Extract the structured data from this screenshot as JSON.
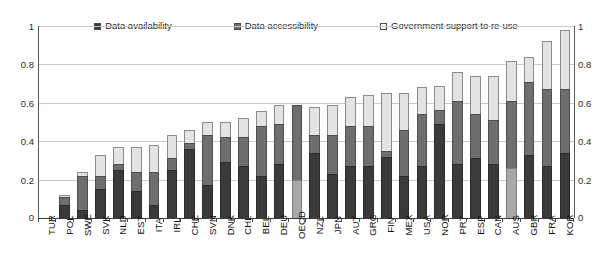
{
  "chart_data": {
    "type": "bar",
    "subtype": "stacked-bar",
    "title": "",
    "subtitle": "",
    "xlabel": "",
    "ylabel": "",
    "ylim": [
      0,
      1
    ],
    "yticks": [
      "0",
      "0.2",
      "0.4",
      "0.6",
      "0.8",
      "1"
    ],
    "ytick_values": [
      0,
      0.2,
      0.4,
      0.6,
      0.8,
      1
    ],
    "right_axis_yticks": [
      "0",
      "0.2",
      "0.4",
      "0.6",
      "0.8",
      "1"
    ],
    "grid": true,
    "grid_axis": "y",
    "legend_position": "top-center",
    "stacked": true,
    "categories": [
      "TUR",
      "POL",
      "SWE",
      "SVK",
      "NLD",
      "EST",
      "ITA",
      "IRL",
      "CHE",
      "SVN",
      "DNK",
      "CHL",
      "BEL",
      "DEU",
      "OECD",
      "NZL",
      "JPN",
      "AUT",
      "GRC",
      "FIN",
      "MEX",
      "USA",
      "NOR",
      "PRT",
      "ESP",
      "CAN",
      "AUS",
      "GBR",
      "FRA",
      "KOR"
    ],
    "series": [
      {
        "name": "Data availability",
        "color": "#3a3a3a",
        "values": [
          0.0,
          0.07,
          0.04,
          0.15,
          0.25,
          0.14,
          0.07,
          0.25,
          0.36,
          0.17,
          0.29,
          0.27,
          0.22,
          0.28,
          0.2,
          0.34,
          0.23,
          0.27,
          0.27,
          0.32,
          0.22,
          0.27,
          0.49,
          0.28,
          0.31,
          0.28,
          0.26,
          0.33,
          0.27,
          0.34
        ]
      },
      {
        "name": "Data accessibility",
        "color": "#6e6e6e",
        "values": [
          0.0,
          0.04,
          0.18,
          0.07,
          0.03,
          0.1,
          0.17,
          0.06,
          0.03,
          0.26,
          0.13,
          0.15,
          0.26,
          0.21,
          0.39,
          0.09,
          0.2,
          0.21,
          0.21,
          0.03,
          0.24,
          0.27,
          0.07,
          0.33,
          0.23,
          0.23,
          0.35,
          0.38,
          0.4,
          0.33
        ]
      },
      {
        "name": "Government support to re-use",
        "color": "#e3e3e3",
        "values": [
          0.0,
          0.01,
          0.02,
          0.11,
          0.09,
          0.13,
          0.14,
          0.12,
          0.07,
          0.07,
          0.08,
          0.1,
          0.08,
          0.1,
          0.0,
          0.15,
          0.16,
          0.15,
          0.16,
          0.3,
          0.19,
          0.14,
          0.13,
          0.15,
          0.2,
          0.23,
          0.21,
          0.13,
          0.25,
          0.31
        ]
      }
    ],
    "totals": [
      0.0,
      0.12,
      0.24,
      0.33,
      0.37,
      0.37,
      0.38,
      0.43,
      0.46,
      0.5,
      0.5,
      0.52,
      0.56,
      0.59,
      0.59,
      0.58,
      0.59,
      0.63,
      0.64,
      0.65,
      0.65,
      0.68,
      0.69,
      0.76,
      0.74,
      0.74,
      0.82,
      0.84,
      0.92,
      0.98
    ],
    "segment_shade_overrides": [
      {
        "category": "OECD",
        "series": "Data availability",
        "color": "#a8a8a8"
      },
      {
        "category": "AUS",
        "series": "Data availability",
        "color": "#a8a8a8"
      }
    ]
  },
  "legend": {
    "items": [
      {
        "label": "Data availability",
        "swatch_color": "#3a3a3a"
      },
      {
        "label": "Data accessibility",
        "swatch_color": "#6e6e6e"
      },
      {
        "label": "Government support to re-use",
        "swatch_color": "#f0f0f0"
      }
    ]
  },
  "axes": {
    "left_ticks": [
      "1",
      "0.8",
      "0.6",
      "0.4",
      "0.2",
      "0"
    ],
    "right_ticks": [
      "1",
      "0.8",
      "0.6",
      "0.4",
      "0.2",
      "0"
    ]
  }
}
